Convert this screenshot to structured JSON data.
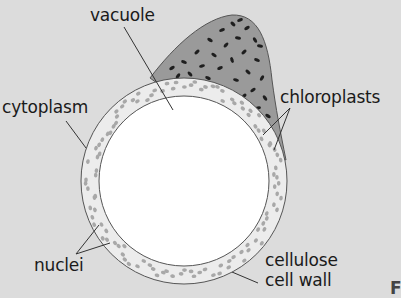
{
  "diagram": {
    "labels": {
      "vacuole": "vacuole",
      "cytoplasm": "cytoplasm",
      "chloroplasts": "chloroplasts",
      "nuclei": "nuclei",
      "cell_wall_line1": "cellulose",
      "cell_wall_line2": "cell wall",
      "corner_letter": "F"
    },
    "colors": {
      "background": "#dcdcdc",
      "cytoplasm_ring": "#ececec",
      "vacuole": "#ffffff",
      "chloroplast_region": "#9a9a9a",
      "chloroplast": "#1e1e1e",
      "nuclei": "#a8a8a8",
      "outline": "#555555",
      "leader_line": "#333333"
    }
  }
}
